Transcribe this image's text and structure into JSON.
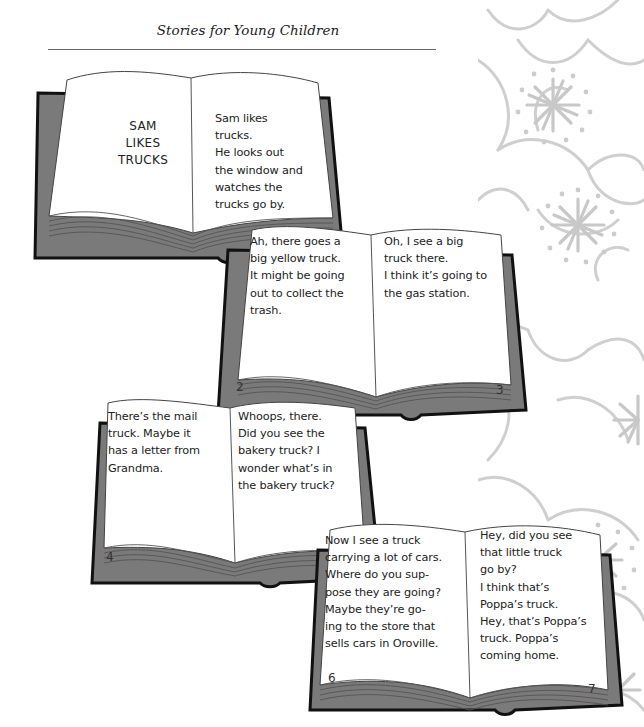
{
  "header": {
    "title": "Stories for Young Children"
  },
  "colors": {
    "cover_gray": "#7a7a7a",
    "cover_edge": "#111111",
    "page_fill": "#ffffff",
    "floral_gray": "#cfcfcf"
  },
  "books": [
    {
      "left_page": {
        "title_lines": "SAM\nLIKES\nTRUCKS",
        "text": "",
        "page_number": ""
      },
      "right_page": {
        "text": "   Sam likes\ntrucks.\n   He looks out\nthe window and\nwatches the\ntrucks go by.",
        "page_number": ""
      }
    },
    {
      "left_page": {
        "text": "   Ah, there goes a\nbig yellow truck.\n   It might be going\nout to collect the\ntrash.",
        "page_number": "2"
      },
      "right_page": {
        "text": "   Oh, I see a big\ntruck there.\n   I think it’s going to\nthe gas station.",
        "page_number": "3"
      }
    },
    {
      "left_page": {
        "text": "   There’s the mail\ntruck. Maybe it\nhas a letter from\nGrandma.",
        "page_number": "4"
      },
      "right_page": {
        "text": "   Whoops, there.\nDid you see the\nbakery truck? I\nwonder what’s in\nthe bakery truck?",
        "page_number": ""
      }
    },
    {
      "left_page": {
        "text": "   Now I see a truck\ncarrying a lot of cars.\n   Where do you sup-\npose they are going?\n   Maybe they’re go-\ning to the store that\nsells cars in Oroville.",
        "page_number": "6"
      },
      "right_page": {
        "text": "   Hey, did you see\nthat little truck\ngo by?\n   I think that’s\nPoppa’s truck.\nHey, that’s Poppa’s\ntruck. Poppa’s\ncoming home.",
        "page_number": "7"
      }
    }
  ]
}
